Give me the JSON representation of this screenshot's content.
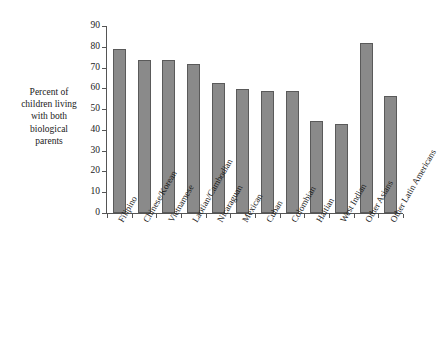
{
  "axis": {
    "y_title_lines": [
      "Percent of",
      "children living",
      "with both",
      "biological",
      "parents"
    ],
    "y_ticks": [
      "0",
      "10",
      "20",
      "30",
      "40",
      "50",
      "60",
      "70",
      "80",
      "90"
    ]
  },
  "colors": {
    "bar_fill": "#8a8a8a",
    "bar_border": "#5a5a5a",
    "axis": "#555555",
    "text": "#1a1a1a",
    "background": "#ffffff"
  },
  "chart_data": {
    "type": "bar",
    "title": "",
    "xlabel": "",
    "ylabel": "Percent of children living with both biological parents",
    "ylim": [
      0,
      90
    ],
    "ytick_step": 10,
    "grid": false,
    "legend": null,
    "orientation": "vertical",
    "categories": [
      "Filipino",
      "Chinese/Korean",
      "Vietnamese",
      "Laotian/Cambodian",
      "Nicaraguan",
      "Mexican",
      "Cuban",
      "Colombian",
      "Haitian",
      "West Indian",
      "Other Asians",
      "Other Latin Americans"
    ],
    "values": [
      79,
      73.5,
      73.5,
      71.5,
      62.5,
      59.5,
      58.5,
      58.5,
      44.5,
      43,
      82,
      56.5
    ]
  }
}
